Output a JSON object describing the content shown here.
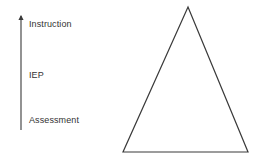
{
  "diagram": {
    "background_color": "#ffffff",
    "stroke_color": "#3a3a3a",
    "text_color": "#333333",
    "arrow": {
      "name": "upward-progression-arrow",
      "direction": "up",
      "x": 21,
      "y_top": 16,
      "y_bottom": 130,
      "stroke_width": 1.1,
      "labels": [
        {
          "id": "instruction",
          "text": "Instruction",
          "position": "top"
        },
        {
          "id": "iep",
          "text": "IEP",
          "position": "middle"
        },
        {
          "id": "assessment",
          "text": "Assessment",
          "position": "bottom"
        }
      ]
    },
    "triangle": {
      "name": "outline-triangle",
      "filled": false,
      "stroke_width": 1.2,
      "apex": {
        "x": 188,
        "y": 7
      },
      "base_left": {
        "x": 123,
        "y": 152
      },
      "base_right": {
        "x": 248,
        "y": 152
      }
    }
  }
}
